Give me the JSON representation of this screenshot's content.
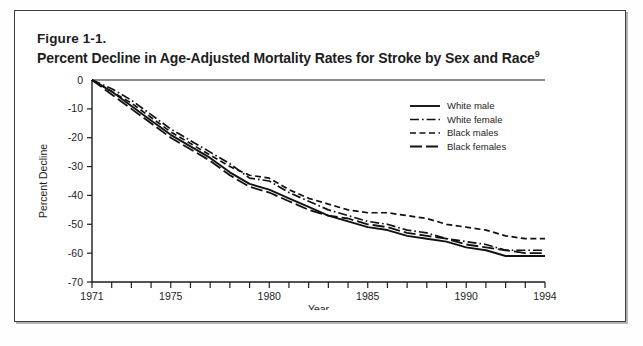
{
  "figure": {
    "number": "Figure 1-1.",
    "title": "Percent Decline in Age-Adjusted Mortality Rates for Stroke by Sex and Race",
    "title_superscript": "9"
  },
  "chart_data": {
    "type": "line",
    "title": "Percent Decline in Age-Adjusted Mortality Rates for Stroke by Sex and Race",
    "xlabel": "Year",
    "ylabel": "Percent Decline",
    "xlim": [
      1971,
      1994
    ],
    "ylim": [
      -70,
      0
    ],
    "yticks": [
      0,
      -10,
      -20,
      -30,
      -40,
      -50,
      -60,
      -70
    ],
    "ytick_labels": [
      "0",
      "-10",
      "-20",
      "-30",
      "-40",
      "-50",
      "-60",
      "-70"
    ],
    "xticks": [
      1971,
      1972,
      1973,
      1974,
      1975,
      1976,
      1977,
      1978,
      1979,
      1980,
      1981,
      1982,
      1983,
      1984,
      1985,
      1986,
      1987,
      1988,
      1989,
      1990,
      1991,
      1992,
      1993,
      1994
    ],
    "xtick_labels": {
      "1971": "1971",
      "1975": "1975",
      "1980": "1980",
      "1985": "1985",
      "1990": "1990",
      "1994": "1994"
    },
    "grid": false,
    "legend_position": "upper right",
    "x": [
      1971,
      1972,
      1973,
      1974,
      1975,
      1976,
      1977,
      1978,
      1979,
      1980,
      1981,
      1982,
      1983,
      1984,
      1985,
      1986,
      1987,
      1988,
      1989,
      1990,
      1991,
      1992,
      1993,
      1994
    ],
    "series": [
      {
        "name": "White male",
        "linestyle": "solid",
        "color": "#111111",
        "values": [
          0,
          -4,
          -9,
          -14,
          -19,
          -23,
          -27,
          -32,
          -36,
          -38,
          -41,
          -44,
          -47,
          -49,
          -51,
          -52,
          -54,
          -55,
          -56,
          -58,
          -59,
          -61,
          -61,
          -61
        ]
      },
      {
        "name": "White female",
        "linestyle": "dashdot",
        "color": "#111111",
        "values": [
          0,
          -3,
          -7,
          -12,
          -17,
          -21,
          -25,
          -29,
          -34,
          -35,
          -39,
          -42,
          -45,
          -47,
          -49,
          -50,
          -52,
          -53,
          -55,
          -56,
          -57,
          -59,
          -59,
          -59
        ]
      },
      {
        "name": "Black males",
        "linestyle": "dashed",
        "color": "#111111",
        "values": [
          0,
          -4,
          -8,
          -13,
          -18,
          -22,
          -26,
          -30,
          -33,
          -34,
          -38,
          -41,
          -43,
          -45,
          -46,
          -46,
          -47,
          -48,
          -50,
          -51,
          -52,
          -54,
          -55,
          -55
        ]
      },
      {
        "name": "Black females",
        "linestyle": "longdash",
        "color": "#111111",
        "values": [
          0,
          -5,
          -10,
          -15,
          -20,
          -24,
          -28,
          -33,
          -37,
          -39,
          -42,
          -45,
          -47,
          -48,
          -50,
          -51,
          -53,
          -54,
          -55,
          -57,
          -58,
          -59,
          -60,
          -60
        ]
      }
    ]
  },
  "legend": {
    "items": [
      {
        "label": "White male"
      },
      {
        "label": "White female"
      },
      {
        "label": "Black males"
      },
      {
        "label": "Black females"
      }
    ]
  }
}
